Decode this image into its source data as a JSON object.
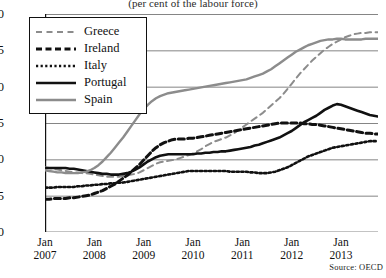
{
  "chart_data": {
    "type": "line",
    "title": "",
    "subtitle": "(per cent of the labour force)",
    "xlabel": "",
    "ylabel": "",
    "ylim": [
      0,
      30
    ],
    "ytick_values": [
      0,
      5,
      10,
      15,
      20,
      25,
      30
    ],
    "grid": true,
    "legend_position": "top-left",
    "source": "Source: OECD",
    "x_tick_labels": [
      {
        "month": "Jan",
        "year": "2007"
      },
      {
        "month": "Jan",
        "year": "2008"
      },
      {
        "month": "Jan",
        "year": "2009"
      },
      {
        "month": "Jan",
        "year": "2010"
      },
      {
        "month": "Jan",
        "year": "2011"
      },
      {
        "month": "Jan",
        "year": "2012"
      },
      {
        "month": "Jan",
        "year": "2013"
      }
    ],
    "x_start": 2007.0,
    "x_end": 2013.75,
    "series": [
      {
        "name": "Greece",
        "style": "dashed-light",
        "color": "#8c8c8c",
        "values": [
          8.9,
          8.8,
          8.7,
          8.6,
          8.5,
          8.4,
          8.3,
          8.2,
          8.2,
          8.1,
          8.1,
          8.0,
          7.9,
          7.8,
          7.7,
          7.6,
          7.6,
          7.6,
          7.6,
          7.7,
          7.8,
          7.9,
          8.0,
          8.2,
          8.5,
          8.8,
          9.1,
          9.4,
          9.6,
          9.7,
          9.8,
          9.9,
          10.0,
          10.2,
          10.4,
          10.6,
          10.8,
          11.1,
          11.4,
          11.8,
          12.1,
          12.4,
          12.6,
          12.8,
          13.0,
          13.3,
          13.6,
          14.0,
          14.4,
          14.8,
          15.2,
          15.6,
          16.0,
          16.4,
          16.9,
          17.4,
          17.9,
          18.4,
          19.0,
          19.7,
          20.4,
          21.1,
          21.8,
          22.4,
          23.0,
          23.6,
          24.1,
          24.6,
          25.1,
          25.5,
          25.9,
          26.2,
          26.5,
          26.8,
          27.0,
          27.2,
          27.3,
          27.4,
          27.4,
          27.5,
          27.5,
          27.5
        ]
      },
      {
        "name": "Ireland",
        "style": "dashed-bold",
        "color": "#111111",
        "values": [
          4.5,
          4.5,
          4.6,
          4.6,
          4.6,
          4.6,
          4.7,
          4.7,
          4.8,
          4.9,
          5.0,
          5.1,
          5.3,
          5.5,
          5.7,
          6.0,
          6.3,
          6.6,
          7.0,
          7.4,
          7.8,
          8.3,
          8.8,
          9.3,
          9.9,
          10.5,
          11.1,
          11.6,
          12.0,
          12.3,
          12.5,
          12.7,
          12.8,
          12.8,
          12.8,
          12.9,
          12.9,
          13.0,
          13.1,
          13.2,
          13.3,
          13.4,
          13.5,
          13.6,
          13.7,
          13.8,
          13.9,
          14.0,
          14.1,
          14.2,
          14.3,
          14.4,
          14.5,
          14.6,
          14.7,
          14.8,
          14.9,
          15.0,
          15.0,
          15.0,
          15.0,
          15.0,
          15.0,
          14.9,
          14.9,
          14.8,
          14.8,
          14.7,
          14.6,
          14.5,
          14.4,
          14.3,
          14.2,
          14.1,
          14.0,
          13.9,
          13.8,
          13.7,
          13.6,
          13.6,
          13.5,
          13.5
        ]
      },
      {
        "name": "Italy",
        "style": "dotted",
        "color": "#111111",
        "values": [
          6.1,
          6.1,
          6.1,
          6.2,
          6.2,
          6.2,
          6.2,
          6.2,
          6.3,
          6.3,
          6.4,
          6.4,
          6.5,
          6.5,
          6.6,
          6.6,
          6.7,
          6.7,
          6.8,
          6.8,
          6.9,
          7.0,
          7.1,
          7.2,
          7.3,
          7.4,
          7.5,
          7.6,
          7.7,
          7.8,
          7.9,
          8.0,
          8.1,
          8.2,
          8.3,
          8.4,
          8.4,
          8.4,
          8.4,
          8.4,
          8.4,
          8.4,
          8.4,
          8.4,
          8.4,
          8.3,
          8.3,
          8.3,
          8.3,
          8.3,
          8.2,
          8.2,
          8.1,
          8.1,
          8.1,
          8.2,
          8.3,
          8.5,
          8.7,
          8.9,
          9.2,
          9.5,
          9.8,
          10.1,
          10.4,
          10.6,
          10.8,
          11.0,
          11.2,
          11.4,
          11.6,
          11.7,
          11.8,
          11.9,
          12.0,
          12.1,
          12.2,
          12.3,
          12.4,
          12.5,
          12.5,
          12.5
        ]
      },
      {
        "name": "Portugal",
        "style": "solid-bold",
        "color": "#111111",
        "values": [
          8.8,
          8.8,
          8.8,
          8.8,
          8.8,
          8.8,
          8.7,
          8.7,
          8.6,
          8.5,
          8.4,
          8.3,
          8.2,
          8.1,
          8.0,
          8.0,
          7.9,
          7.9,
          7.9,
          8.0,
          8.1,
          8.3,
          8.6,
          8.9,
          9.3,
          9.7,
          10.0,
          10.3,
          10.5,
          10.6,
          10.7,
          10.7,
          10.7,
          10.7,
          10.7,
          10.7,
          10.7,
          10.8,
          10.8,
          10.9,
          10.9,
          11.0,
          11.0,
          11.1,
          11.1,
          11.2,
          11.3,
          11.4,
          11.5,
          11.6,
          11.7,
          11.9,
          12.0,
          12.2,
          12.4,
          12.6,
          12.8,
          13.0,
          13.3,
          13.6,
          13.9,
          14.3,
          14.7,
          15.1,
          15.4,
          15.7,
          16.0,
          16.4,
          16.8,
          17.1,
          17.4,
          17.6,
          17.5,
          17.3,
          17.1,
          16.9,
          16.7,
          16.5,
          16.3,
          16.1,
          16.0,
          15.9
        ]
      },
      {
        "name": "Spain",
        "style": "solid-light",
        "color": "#8c8c8c",
        "values": [
          8.5,
          8.4,
          8.3,
          8.2,
          8.2,
          8.1,
          8.1,
          8.1,
          8.1,
          8.2,
          8.3,
          8.5,
          8.8,
          9.2,
          9.7,
          10.3,
          10.9,
          11.6,
          12.3,
          13.0,
          13.8,
          14.6,
          15.4,
          16.2,
          16.9,
          17.5,
          18.0,
          18.4,
          18.7,
          18.9,
          19.1,
          19.2,
          19.3,
          19.4,
          19.5,
          19.6,
          19.7,
          19.8,
          19.9,
          20.0,
          20.1,
          20.2,
          20.3,
          20.4,
          20.5,
          20.6,
          20.7,
          20.8,
          20.9,
          21.0,
          21.2,
          21.4,
          21.6,
          21.8,
          22.1,
          22.4,
          22.8,
          23.2,
          23.6,
          24.0,
          24.4,
          24.8,
          25.1,
          25.4,
          25.7,
          25.9,
          26.1,
          26.3,
          26.4,
          26.5,
          26.5,
          26.6,
          26.6,
          26.5,
          26.5,
          26.5,
          26.5,
          26.5,
          26.6,
          26.6,
          26.6,
          26.6
        ]
      }
    ]
  },
  "legend": {
    "items": [
      {
        "label": "Greece"
      },
      {
        "label": "Ireland"
      },
      {
        "label": "Italy"
      },
      {
        "label": "Portugal"
      },
      {
        "label": "Spain"
      }
    ]
  }
}
